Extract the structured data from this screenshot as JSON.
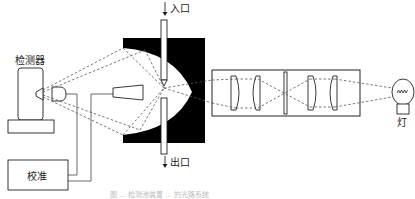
{
  "diagram": {
    "labels": {
      "detector": "检测器",
      "inlet": "入口",
      "outlet": "出口",
      "calibration": "校准",
      "lamp": "灯"
    },
    "caption": "图 ... 检测池装置 ... 的光路系统"
  }
}
